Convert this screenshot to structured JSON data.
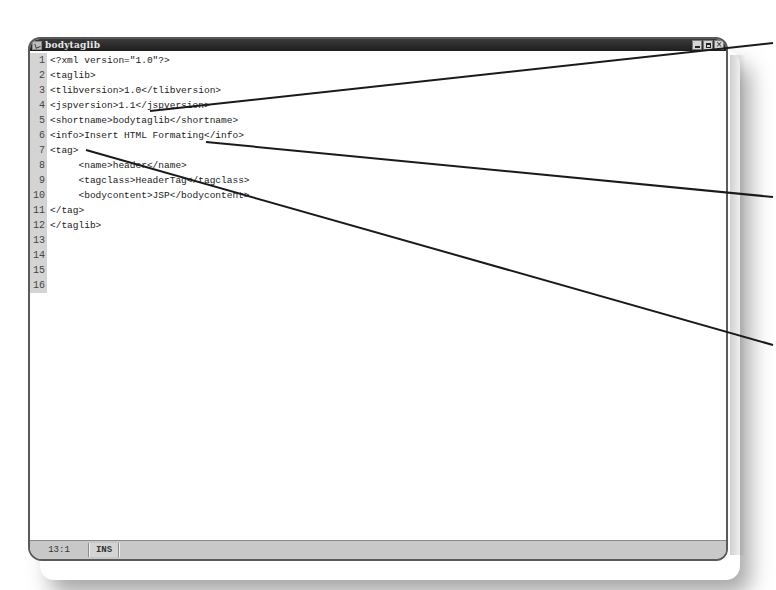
{
  "window": {
    "title": "bodytaglib",
    "icon": "document-edit-icon",
    "buttons": {
      "minimize": "minimize-icon",
      "maximize": "maximize-icon",
      "close": "×"
    }
  },
  "editor": {
    "lines": [
      {
        "num": "1",
        "text": "<?xml version=\"1.0\"?>"
      },
      {
        "num": "2",
        "text": "<taglib>"
      },
      {
        "num": "3",
        "text": "<tlibversion>1.0</tlibversion>"
      },
      {
        "num": "4",
        "text": "<jspversion>1.1</jspversion>"
      },
      {
        "num": "5",
        "text": "<shortname>bodytaglib</shortname>"
      },
      {
        "num": "6",
        "text": "<info>Insert HTML Formating</info>"
      },
      {
        "num": "7",
        "text": "<tag>"
      },
      {
        "num": "8",
        "text": "     <name>header</name>"
      },
      {
        "num": "9",
        "text": "     <tagclass>HeaderTag</tagclass>"
      },
      {
        "num": "10",
        "text": "     <bodycontent>JSP</bodycontent>"
      },
      {
        "num": "11",
        "text": "</tag>"
      },
      {
        "num": "12",
        "text": "</taglib>"
      },
      {
        "num": "13",
        "text": ""
      },
      {
        "num": "14",
        "text": ""
      },
      {
        "num": "15",
        "text": ""
      },
      {
        "num": "16",
        "text": ""
      }
    ]
  },
  "statusbar": {
    "position": "13:1",
    "mode": "INS"
  },
  "callouts": [
    {
      "from": [
        150,
        111
      ],
      "to": [
        773,
        43
      ]
    },
    {
      "from": [
        206,
        142
      ],
      "to": [
        773,
        197
      ]
    },
    {
      "from": [
        86,
        150
      ],
      "to": [
        773,
        345
      ]
    }
  ],
  "colors": {
    "titlebar": "#2a2a2a",
    "gutter": "#d4d4d4",
    "statusbar": "#c8c8c8",
    "callout_line": "#1a1a1a"
  }
}
